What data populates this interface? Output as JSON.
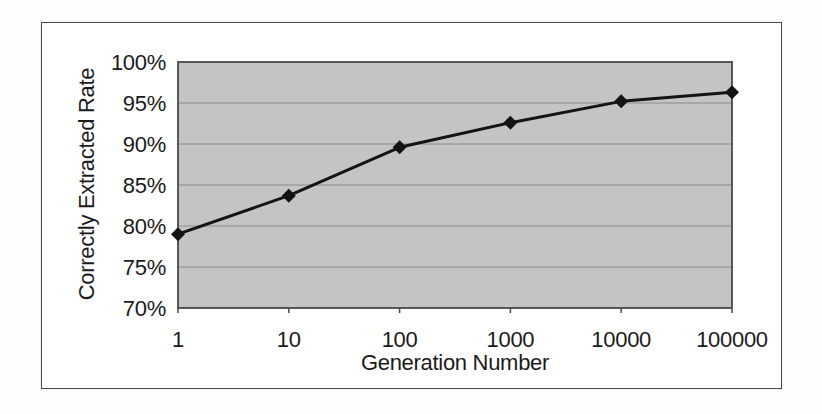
{
  "figure": {
    "frame_color": "#4c4c4c",
    "background_color": "#ffffff"
  },
  "chart_data": {
    "type": "line",
    "title": "",
    "xlabel": "Generation Number",
    "ylabel": "Correctly Extracted Rate",
    "x_scale": "log-category",
    "categories": [
      "1",
      "10",
      "100",
      "1000",
      "10000",
      "100000"
    ],
    "series": [
      {
        "name": "Correctly Extracted Rate",
        "values": [
          79.0,
          83.7,
          89.6,
          92.6,
          95.2,
          96.3
        ],
        "color": "#141414",
        "marker": "diamond",
        "line_width": 3
      }
    ],
    "ylim": [
      70,
      100
    ],
    "y_tick_values": [
      70,
      75,
      80,
      85,
      90,
      95,
      100
    ],
    "y_ticks": [
      "70%",
      "75%",
      "80%",
      "85%",
      "90%",
      "95%",
      "100%"
    ],
    "grid": "horizontal",
    "legend": "none",
    "plot_bg": "#c4c4c4",
    "grid_color": "#8c8c8c",
    "axis_color": "#4a4a4a",
    "text_color": "#1b1b1b"
  }
}
